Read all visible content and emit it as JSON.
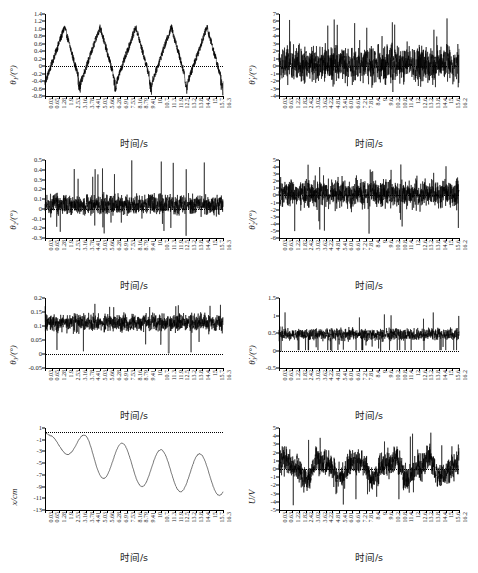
{
  "figure": {
    "kind": "multi-panel-time-series-figure",
    "background": "#ffffff",
    "line_color": "#000000",
    "panel_count": 8,
    "columns": 2,
    "rows": 4
  },
  "axis_common": {
    "xlabel": "时间/s",
    "x_unit": "s",
    "degree_unit": "(°)"
  },
  "xticks_left": [
    "0.03",
    "0.65",
    "1.28",
    "1.9",
    "2.53",
    "3.16",
    "3.78",
    "4.41",
    "5.03",
    "5.66",
    "6.28",
    "6.91",
    "7.53",
    "8.16",
    "8.79",
    "9.41",
    "10",
    "10.7",
    "11.3",
    "11.9",
    "12.5",
    "13.2",
    "13.8",
    "14.4",
    "15",
    "15.7",
    "16.3"
  ],
  "xticks_right": [
    "0.03",
    "0.63",
    "1.22",
    "1.82",
    "2.42",
    "3.02",
    "3.62",
    "4.22",
    "4.81",
    "5.41",
    "6.01",
    "6.61",
    "7.21",
    "7.81",
    "8.4",
    "9",
    "9.6",
    "10.2",
    "10.8",
    "11.4",
    "12",
    "12.6",
    "13.2",
    "13.8",
    "14.4",
    "15",
    "15.6",
    "16.2"
  ],
  "chart_data": [
    {
      "id": "theta1",
      "type": "line",
      "title": "",
      "position": "row1-left",
      "ylabel": "θ₁/(°)",
      "ylabel_symbol": "θ",
      "ylabel_sub": "1",
      "xlabel": "时间/s",
      "xlim": [
        0,
        16.3
      ],
      "ylim": [
        -0.8,
        1.4
      ],
      "yticks": [
        "1.4",
        "1.2",
        "1.0",
        "0.8",
        "0.6",
        "0.4",
        "0.2",
        "0",
        "-0.2",
        "-0.4",
        "-0.6",
        "-0.8"
      ],
      "ytick_values": [
        1.4,
        1.2,
        1.0,
        0.8,
        0.6,
        0.4,
        0.2,
        0,
        -0.2,
        -0.4,
        -0.6,
        -0.8
      ],
      "grid": false,
      "legend": "none",
      "description": "periodic sawtooth-like oscillation, 5 cycles, noisy ramp up to ~1.0 then drop to ~-0.5",
      "zero_reference_dotted": true,
      "series": [
        {
          "name": "theta1",
          "signal": "periodic",
          "cycles": 5,
          "peak": 1.05,
          "trough": -0.72,
          "noise": 0.09
        }
      ]
    },
    {
      "id": "theta1dot",
      "type": "line",
      "position": "row1-right",
      "ylabel": "θ̇₁/(°)",
      "ylabel_symbol": "θ̇",
      "ylabel_sub": "1",
      "xlabel": "时间/s",
      "xlim": [
        0,
        16.2
      ],
      "ylim": [
        -4,
        7
      ],
      "yticks": [
        "7",
        "6",
        "5",
        "4",
        "3",
        "2",
        "1",
        "0",
        "-1",
        "-2",
        "-3",
        "-4"
      ],
      "ytick_values": [
        7,
        6,
        5,
        4,
        3,
        2,
        1,
        0,
        -1,
        -2,
        -3,
        -4
      ],
      "grid": false,
      "legend": "none",
      "description": "dense high-frequency noise centred on 0, spikes to +6.5 and -4",
      "zero_reference_dotted": true,
      "series": [
        {
          "name": "theta1dot",
          "signal": "noise",
          "mean": 0.3,
          "amplitude": 2.3,
          "peak": 6.6,
          "trough": -4.0
        }
      ]
    },
    {
      "id": "theta2",
      "type": "line",
      "position": "row2-left",
      "ylabel": "θ₂/(°)",
      "ylabel_symbol": "θ",
      "ylabel_sub": "2",
      "xlabel": "时间/s",
      "xlim": [
        0,
        16.3
      ],
      "ylim": [
        -0.3,
        0.5
      ],
      "yticks": [
        "0.5",
        "0.4",
        "0.3",
        "0.2",
        "0.1",
        "0",
        "-0.1",
        "-0.2",
        "-0.3"
      ],
      "ytick_values": [
        0.5,
        0.4,
        0.3,
        0.2,
        0.1,
        0,
        -0.1,
        -0.2,
        -0.3
      ],
      "grid": false,
      "legend": "none",
      "description": "noisy signal mostly 0 to 0.2 with occasional spikes to 0.5 and dips to -0.27",
      "zero_reference_dotted": true,
      "series": [
        {
          "name": "theta2",
          "signal": "noise",
          "mean": 0.04,
          "amplitude": 0.1,
          "peak": 0.51,
          "trough": -0.28
        }
      ]
    },
    {
      "id": "theta2dot",
      "type": "line",
      "position": "row2-right",
      "ylabel": "θ̇₂/(°)",
      "ylabel_symbol": "θ̇",
      "ylabel_sub": "2",
      "xlabel": "时间/s",
      "xlim": [
        0,
        16.2
      ],
      "ylim": [
        -6,
        5
      ],
      "yticks": [
        "5",
        "4",
        "3",
        "2",
        "1",
        "0",
        "-1",
        "-2",
        "-3",
        "-4",
        "-5",
        "-6"
      ],
      "ytick_values": [
        5,
        4,
        3,
        2,
        1,
        0,
        -1,
        -2,
        -3,
        -4,
        -5,
        -6
      ],
      "grid": false,
      "legend": "none",
      "description": "dense high-frequency noise centred on 0, spikes to +4.5 and -5.5",
      "zero_reference_dotted": true,
      "series": [
        {
          "name": "theta2dot",
          "signal": "noise",
          "mean": 0.2,
          "amplitude": 1.9,
          "peak": 4.6,
          "trough": -5.6
        }
      ]
    },
    {
      "id": "theta3",
      "type": "line",
      "position": "row3-left",
      "ylabel": "θ₃/(°)",
      "ylabel_symbol": "θ",
      "ylabel_sub": "3",
      "xlabel": "时间/s",
      "xlim": [
        0,
        16.3
      ],
      "ylim": [
        -0.05,
        0.2
      ],
      "yticks": [
        "0.2",
        "0.15",
        "0.1",
        "0.05",
        "0",
        "-0.05"
      ],
      "ytick_values": [
        0.2,
        0.15,
        0.1,
        0.05,
        0,
        -0.05
      ],
      "grid": false,
      "legend": "none",
      "description": "noise band around 0.11, range 0.03 to 0.19, with one drop to 0 near 11.3 s",
      "zero_reference_dotted": true,
      "series": [
        {
          "name": "theta3",
          "signal": "noise",
          "mean": 0.112,
          "amplitude": 0.03,
          "peak": 0.195,
          "trough": 0.0
        }
      ]
    },
    {
      "id": "theta3dot",
      "type": "line",
      "position": "row3-right",
      "ylabel": "θ̇₃/(°)",
      "ylabel_symbol": "θ̇",
      "ylabel_sub": "3",
      "xlabel": "时间/s",
      "xlim": [
        0,
        16.3
      ],
      "ylim": [
        -0.5,
        1.5
      ],
      "yticks": [
        "1.5",
        "1",
        "0.5",
        "0",
        "-0.5"
      ],
      "ytick_values": [
        1.5,
        1,
        0.5,
        0,
        -0.5
      ],
      "grid": false,
      "legend": "none",
      "description": "noise band around 0.45, spikes to 1.2, occasional dips to 0",
      "zero_reference_dotted": true,
      "series": [
        {
          "name": "theta3dot",
          "signal": "noise",
          "mean": 0.46,
          "amplitude": 0.16,
          "peak": 1.2,
          "trough": -0.05
        }
      ]
    },
    {
      "id": "x_position",
      "type": "line",
      "position": "row4-left",
      "ylabel": "x/cm",
      "ylabel_symbol": "x",
      "xlabel": "时间/s",
      "xlim": [
        0,
        16.3
      ],
      "ylim": [
        -13,
        1
      ],
      "yticks": [
        "1",
        "-1",
        "-3",
        "-5",
        "-7",
        "-9",
        "-11",
        "-13"
      ],
      "ytick_values": [
        1,
        -1,
        -3,
        -5,
        -7,
        -9,
        -11,
        -13
      ],
      "grid": false,
      "legend": "none",
      "description": "smooth damped oscillating drift starting at 0, descending and oscillating between about -3 and -12",
      "zero_reference_dotted": true,
      "series": [
        {
          "name": "x",
          "signal": "smooth-oscillation",
          "start": 0.2,
          "peak": 0.3,
          "trough": -11.8,
          "cycles": 5
        }
      ]
    },
    {
      "id": "U_voltage",
      "type": "line",
      "position": "row4-right",
      "ylabel": "U/V",
      "ylabel_symbol": "U",
      "xlabel": "时间/s",
      "xlim": [
        0,
        16.2
      ],
      "ylim": [
        -5,
        5
      ],
      "yticks": [
        "5",
        "4",
        "3",
        "2",
        "1",
        "0",
        "-1",
        "-2",
        "-3",
        "-4",
        "-5"
      ],
      "ytick_values": [
        5,
        4,
        3,
        2,
        1,
        0,
        -1,
        -2,
        -3,
        -4,
        -5
      ],
      "grid": false,
      "legend": "none",
      "description": "burst-like noisy control voltage alternating between positive clusters (up to 4.5) and negative clusters (down to -4.5)",
      "zero_reference_dotted": true,
      "series": [
        {
          "name": "U",
          "signal": "burst-noise",
          "mean": 0.1,
          "amplitude": 1.6,
          "peak": 4.5,
          "trough": -4.5
        }
      ]
    }
  ]
}
